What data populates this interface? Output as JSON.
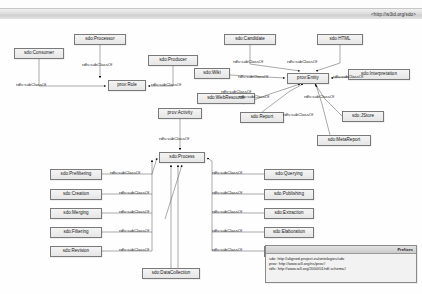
{
  "window": {
    "ontology_uri": "<http://w3id.org/sdo>"
  },
  "nodes": [
    {
      "id": "sdo-consumer",
      "label": "sdo:Consumer",
      "x": 14,
      "y": 29,
      "w": 50,
      "h": 11
    },
    {
      "id": "sdo-processor",
      "label": "sdo:Processor",
      "x": 74,
      "y": 15,
      "w": 52,
      "h": 11
    },
    {
      "id": "prov-role",
      "label": "prov:Role",
      "x": 108,
      "y": 61,
      "w": 38,
      "h": 11
    },
    {
      "id": "sdo-producer",
      "label": "sdo:Producer",
      "x": 148,
      "y": 36,
      "w": 50,
      "h": 11
    },
    {
      "id": "sdo-candidate",
      "label": "sdo:Candidate",
      "x": 224,
      "y": 15,
      "w": 52,
      "h": 11
    },
    {
      "id": "sdo-html",
      "label": "sdo:HTML",
      "x": 317,
      "y": 15,
      "w": 46,
      "h": 11
    },
    {
      "id": "sdo-wiki",
      "label": "sdo:Wiki",
      "x": 194,
      "y": 49,
      "w": 36,
      "h": 11
    },
    {
      "id": "prov-entity",
      "label": "prov:Entity",
      "x": 287,
      "y": 54,
      "w": 42,
      "h": 11
    },
    {
      "id": "sdo-interpretation",
      "label": "sdo:Interpretation",
      "x": 348,
      "y": 50,
      "w": 62,
      "h": 11
    },
    {
      "id": "prov-activity",
      "label": "prov:Activity",
      "x": 158,
      "y": 89,
      "w": 44,
      "h": 11
    },
    {
      "id": "sdo-webresource",
      "label": "sdo:WebResource",
      "x": 197,
      "y": 74,
      "w": 58,
      "h": 11
    },
    {
      "id": "sdo-report",
      "label": "sdo:Report",
      "x": 240,
      "y": 93,
      "w": 44,
      "h": 11
    },
    {
      "id": "sdo-jstore",
      "label": "sdo:JStore",
      "x": 342,
      "y": 92,
      "w": 42,
      "h": 11
    },
    {
      "id": "sdo-metareport",
      "label": "sdo:MetaReport",
      "x": 317,
      "y": 116,
      "w": 54,
      "h": 11
    },
    {
      "id": "sdo-process",
      "label": "sdo:Process",
      "x": 159,
      "y": 133,
      "w": 46,
      "h": 11
    },
    {
      "id": "sdo-prefiltering",
      "label": "sdo:Prefiltering",
      "x": 50,
      "y": 150,
      "w": 52,
      "h": 11
    },
    {
      "id": "sdo-creation",
      "label": "sdo:Creation",
      "x": 50,
      "y": 170,
      "w": 52,
      "h": 11
    },
    {
      "id": "sdo-merging",
      "label": "sdo:Merging",
      "x": 50,
      "y": 189,
      "w": 52,
      "h": 11
    },
    {
      "id": "sdo-filtering",
      "label": "sdo:Filtering",
      "x": 50,
      "y": 208,
      "w": 52,
      "h": 11
    },
    {
      "id": "sdo-revision",
      "label": "sdo:Revision",
      "x": 50,
      "y": 227,
      "w": 52,
      "h": 11
    },
    {
      "id": "sdo-querying",
      "label": "sdo:Querying",
      "x": 264,
      "y": 150,
      "w": 50,
      "h": 11
    },
    {
      "id": "sdo-publishing",
      "label": "sdo:Publishing",
      "x": 264,
      "y": 170,
      "w": 50,
      "h": 11
    },
    {
      "id": "sdo-extraction",
      "label": "sdo:Extraction",
      "x": 264,
      "y": 189,
      "w": 50,
      "h": 11
    },
    {
      "id": "sdo-elaboration",
      "label": "sdo:Elaboration",
      "x": 264,
      "y": 208,
      "w": 50,
      "h": 11
    },
    {
      "id": "sdo-updating",
      "label": "sdo:Updating",
      "x": 264,
      "y": 227,
      "w": 50,
      "h": 11
    },
    {
      "id": "sdo-datacollection",
      "label": "sdo:DataCollection",
      "x": 142,
      "y": 249,
      "w": 58,
      "h": 11
    }
  ],
  "edge_labels": [
    {
      "id": "el-consumer-role",
      "text": "rdfs:subClassOf",
      "x": 16,
      "y": 64
    },
    {
      "id": "el-processor-role",
      "text": "rdfs:subClassOf",
      "x": 82,
      "y": 44
    },
    {
      "id": "el-producer-role",
      "text": "rdfs:subClassOf",
      "x": 151,
      "y": 64
    },
    {
      "id": "el-candidate-entity",
      "text": "rdfs:subClassOf",
      "x": 233,
      "y": 41
    },
    {
      "id": "el-html-entity",
      "text": "rdfs:subClassOf",
      "x": 287,
      "y": 41
    },
    {
      "id": "el-wiki-entity",
      "text": "rdfs:subClassOf",
      "x": 238,
      "y": 56
    },
    {
      "id": "el-interp-entity",
      "text": "rdfs:subClassOf",
      "x": 333,
      "y": 56
    },
    {
      "id": "el-webres-entity",
      "text": "rdfs:subClassOf",
      "x": 221,
      "y": 71
    },
    {
      "id": "el-report-entity",
      "text": "rdfs:subClassOf",
      "x": 239,
      "y": 76
    },
    {
      "id": "el-jstore-entity",
      "text": "rdfs:subClassOf",
      "x": 304,
      "y": 76
    },
    {
      "id": "el-metareport-entity",
      "text": "rdfs:subClassOf",
      "x": 283,
      "y": 94
    },
    {
      "id": "el-activity-process",
      "text": "rdfs:subClassOf",
      "x": 159,
      "y": 118
    },
    {
      "id": "el-prefiltering",
      "text": "rdfs:subClassOf",
      "x": 110,
      "y": 152
    },
    {
      "id": "el-creation",
      "text": "rdfs:subClassOf",
      "x": 119,
      "y": 172
    },
    {
      "id": "el-merging",
      "text": "rdfs:subClassOf",
      "x": 119,
      "y": 191
    },
    {
      "id": "el-filtering",
      "text": "rdfs:subClassOf",
      "x": 119,
      "y": 210
    },
    {
      "id": "el-revision",
      "text": "rdfs:subClassOf",
      "x": 119,
      "y": 229
    },
    {
      "id": "el-querying",
      "text": "rdfs:subClassOf",
      "x": 212,
      "y": 152
    },
    {
      "id": "el-publishing",
      "text": "rdfs:subClassOf",
      "x": 212,
      "y": 172
    },
    {
      "id": "el-extraction",
      "text": "rdfs:subClassOf",
      "x": 212,
      "y": 191
    },
    {
      "id": "el-elaboration",
      "text": "rdfs:subClassOf",
      "x": 212,
      "y": 210
    },
    {
      "id": "el-updating",
      "text": "rdfs:subClassOf",
      "x": 212,
      "y": 229
    }
  ],
  "prefixes": {
    "title": "Prefixes",
    "lines": [
      "sdo: http://aligned-project.eu/ontologies/sdo",
      "prov: http://www.w3.org/ns/prov#",
      "rdfs: http://www.w3.org/2000/01/rdf-schema#"
    ]
  }
}
